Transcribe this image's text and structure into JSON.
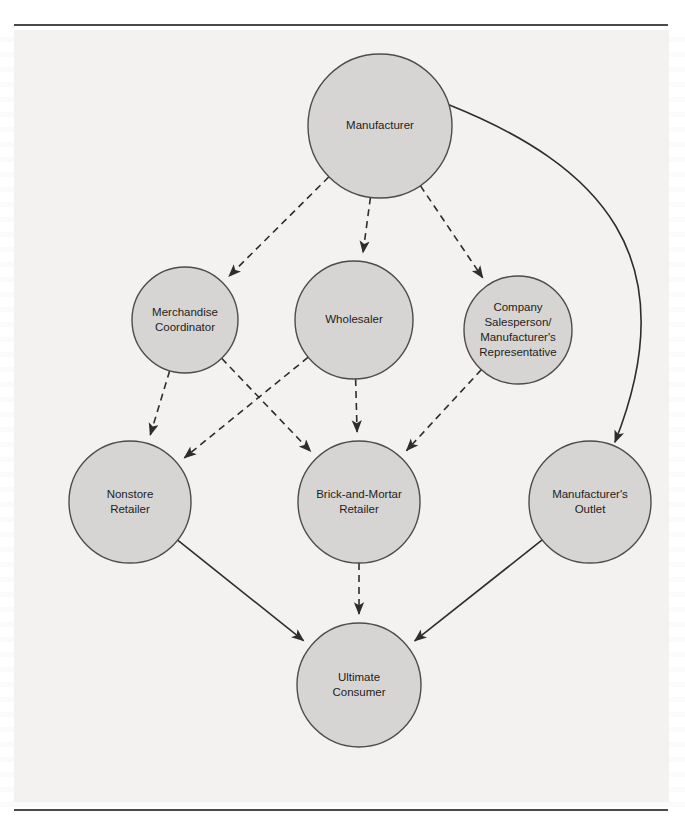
{
  "figure": {
    "background_color": "#f3f2f1",
    "node_fill": "#d7d5d3",
    "node_stroke": "#4c4c4c",
    "edge_color": "#2d2d2d"
  },
  "nodes": [
    {
      "id": "manufacturer",
      "lines": [
        "Manufacturer"
      ],
      "cx": 366,
      "cy": 96,
      "r": 72
    },
    {
      "id": "merchandise",
      "lines": [
        "Merchandise",
        "Coordinator"
      ],
      "cx": 171,
      "cy": 290,
      "r": 53
    },
    {
      "id": "wholesaler",
      "lines": [
        "Wholesaler"
      ],
      "cx": 340,
      "cy": 290,
      "r": 59
    },
    {
      "id": "salesperson",
      "lines": [
        "Company",
        "Salesperson/",
        "Manufacturer's",
        "Representative"
      ],
      "cx": 504,
      "cy": 300,
      "r": 54
    },
    {
      "id": "nonstore",
      "lines": [
        "Nonstore",
        "Retailer"
      ],
      "cx": 116,
      "cy": 472,
      "r": 61
    },
    {
      "id": "brick",
      "lines": [
        "Brick-and-Mortar",
        "Retailer"
      ],
      "cx": 345,
      "cy": 472,
      "r": 61
    },
    {
      "id": "outlet",
      "lines": [
        "Manufacturer's",
        "Outlet"
      ],
      "cx": 576,
      "cy": 472,
      "r": 61
    },
    {
      "id": "consumer",
      "lines": [
        "Ultimate",
        "Consumer"
      ],
      "cx": 345,
      "cy": 655,
      "r": 62
    }
  ],
  "edges": [
    {
      "id": "manufacturer-to-merchandise",
      "from": "manufacturer",
      "to": "merchandise",
      "style": "dashed",
      "arrow": true
    },
    {
      "id": "manufacturer-to-wholesaler",
      "from": "manufacturer",
      "to": "wholesaler",
      "style": "dashed",
      "arrow": true
    },
    {
      "id": "manufacturer-to-salesperson",
      "from": "manufacturer",
      "to": "salesperson",
      "style": "dashed",
      "arrow": true
    },
    {
      "id": "manufacturer-to-outlet",
      "from": "manufacturer",
      "to": "outlet",
      "style": "solid",
      "arrow": true
    },
    {
      "id": "merchandise-to-nonstore",
      "from": "merchandise",
      "to": "nonstore",
      "style": "dashed",
      "arrow": true
    },
    {
      "id": "merchandise-to-brick",
      "from": "merchandise",
      "to": "brick",
      "style": "dashed",
      "arrow": true
    },
    {
      "id": "wholesaler-to-nonstore",
      "from": "wholesaler",
      "to": "nonstore",
      "style": "dashed",
      "arrow": true
    },
    {
      "id": "wholesaler-to-brick",
      "from": "wholesaler",
      "to": "brick",
      "style": "dashed",
      "arrow": true
    },
    {
      "id": "salesperson-to-brick",
      "from": "salesperson",
      "to": "brick",
      "style": "dashed",
      "arrow": true
    },
    {
      "id": "nonstore-to-consumer",
      "from": "nonstore",
      "to": "consumer",
      "style": "solid",
      "arrow": true
    },
    {
      "id": "brick-to-consumer",
      "from": "brick",
      "to": "consumer",
      "style": "dashed",
      "arrow": true
    },
    {
      "id": "outlet-to-consumer",
      "from": "outlet",
      "to": "consumer",
      "style": "solid",
      "arrow": true
    }
  ]
}
